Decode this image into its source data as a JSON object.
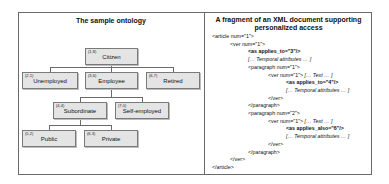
{
  "left_panel": {
    "title": "The sample ontology",
    "nodes": [
      {
        "code": "(1,8)",
        "label": "Citizen"
      },
      {
        "code": "(2,1)",
        "label": "Unemployed"
      },
      {
        "code": "(3,6)",
        "label": "Employee"
      },
      {
        "code": "(6,7)",
        "label": "Retired"
      },
      {
        "code": "(4,4)",
        "label": "Subordinate"
      },
      {
        "code": "(7,0)",
        "label": "Self-employed"
      },
      {
        "code": "(5,2)",
        "label": "Public"
      },
      {
        "code": "(6,3)",
        "label": "Private"
      }
    ]
  },
  "right_panel": {
    "title_line1": "A fragment of an XML document supporting",
    "title_line2": "personalized access",
    "lines": [
      {
        "text": "<article num=\"1\">",
        "indent": 0,
        "style": "normal"
      },
      {
        "text": "<ver num=\"1\">",
        "indent": 1,
        "style": "normal"
      },
      {
        "text": "<as applies_to=\"3\"/>",
        "indent": 2,
        "style": "bold"
      },
      {
        "text": "[… Temporal attributes … ]",
        "indent": 2,
        "style": "italic"
      },
      {
        "text": "<paragraph num=\"1\">",
        "indent": 2,
        "style": "normal"
      },
      {
        "text": "<ver num=\"1\">",
        "suffix": " [… Text … ]",
        "indent": 3,
        "style": "normal"
      },
      {
        "text": "<as applies_to=\"4\"/>",
        "indent": 4,
        "style": "bold"
      },
      {
        "text": "[… Temporal attributes … ]",
        "indent": 4,
        "style": "italic"
      },
      {
        "text": "</ver>",
        "indent": 3,
        "style": "normal"
      },
      {
        "text": "</paragraph>",
        "indent": 2,
        "style": "normal"
      },
      {
        "text": "<paragraph num=\"2\">",
        "indent": 2,
        "style": "normal"
      },
      {
        "text": "<ver num=\"1\">",
        "suffix": " [… Text … ]",
        "indent": 3,
        "style": "normal"
      },
      {
        "text": "<as applies_also=\"6\"/>",
        "indent": 4,
        "style": "bold"
      },
      {
        "text": "[… Temporal attributes … ]",
        "indent": 4,
        "style": "italic"
      },
      {
        "text": "</ver>",
        "indent": 3,
        "style": "normal"
      },
      {
        "text": "</paragraph>",
        "indent": 2,
        "style": "normal"
      },
      {
        "text": "</ver>",
        "indent": 1,
        "style": "normal"
      },
      {
        "text": "</article>",
        "indent": 0,
        "style": "normal"
      }
    ]
  }
}
